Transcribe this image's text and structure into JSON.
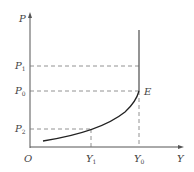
{
  "diagram": {
    "axes": {
      "y_label": "P",
      "x_label": "Y",
      "origin_label": "O"
    },
    "price_levels": [
      {
        "base": "P",
        "sub": "1"
      },
      {
        "base": "P",
        "sub": "0"
      },
      {
        "base": "P",
        "sub": "2"
      }
    ],
    "output_levels": [
      {
        "base": "Y",
        "sub": "1"
      },
      {
        "base": "Y",
        "sub": "0"
      }
    ],
    "point_label": "E",
    "colors": {
      "axis": "#555555",
      "curve": "#222222",
      "dashed": "#777777",
      "vertical": "#666666"
    }
  }
}
